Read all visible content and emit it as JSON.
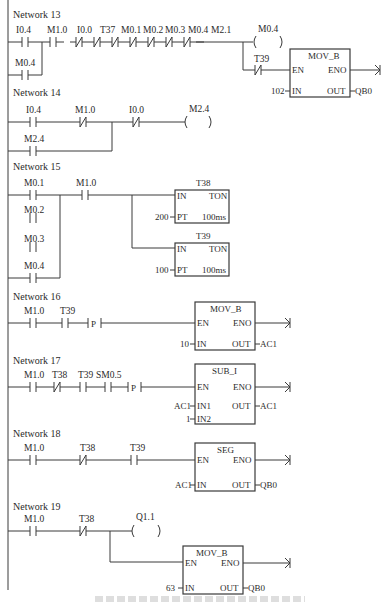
{
  "networks": [
    {
      "title": "Network 13",
      "contacts": [
        {
          "label": "I0.4",
          "type": "NO"
        },
        {
          "label": "M0.4",
          "type": "NO"
        },
        {
          "label": "M1.0",
          "type": "NO"
        },
        {
          "label": "I0.0",
          "type": "NC"
        },
        {
          "label": "T37",
          "type": "NC"
        },
        {
          "label": "M0.1",
          "type": "NC"
        },
        {
          "label": "M0.2",
          "type": "NC"
        },
        {
          "label": "M0.3",
          "type": "NC"
        },
        {
          "label": "M0.4",
          "type": "NC"
        },
        {
          "label": "M2.1",
          "type": "NC"
        },
        {
          "label": "T39",
          "type": "NC"
        }
      ],
      "coil": "M0.4",
      "block": {
        "name": "MOV_B",
        "en": "EN",
        "eno": "ENO",
        "in": "IN",
        "out": "OUT",
        "in_val": "102",
        "out_val": "QB0"
      }
    },
    {
      "title": "Network 14",
      "contacts": [
        {
          "label": "I0.4",
          "type": "NO"
        },
        {
          "label": "M1.0",
          "type": "NC"
        },
        {
          "label": "I0.0",
          "type": "NC"
        },
        {
          "label": "M2.4",
          "type": "NO"
        }
      ],
      "coil": "M2.4"
    },
    {
      "title": "Network 15",
      "contacts": [
        {
          "label": "M0.1",
          "type": "NO"
        },
        {
          "label": "M0.2",
          "type": "NO"
        },
        {
          "label": "M0.3",
          "type": "NO"
        },
        {
          "label": "M0.4",
          "type": "NO"
        },
        {
          "label": "M1.0",
          "type": "NO"
        }
      ],
      "timers": [
        {
          "name": "T38",
          "in": "IN",
          "type": "TON",
          "pt": "PT",
          "pt_val": "200",
          "base": "100ms"
        },
        {
          "name": "T39",
          "in": "IN",
          "type": "TON",
          "pt": "PT",
          "pt_val": "100",
          "base": "100ms"
        }
      ]
    },
    {
      "title": "Network 16",
      "contacts": [
        {
          "label": "M1.0",
          "type": "NO"
        },
        {
          "label": "T39",
          "type": "NO"
        }
      ],
      "edge": "P",
      "block": {
        "name": "MOV_B",
        "en": "EN",
        "eno": "ENO",
        "in": "IN",
        "out": "OUT",
        "in_val": "10",
        "out_val": "AC1"
      }
    },
    {
      "title": "Network 17",
      "contacts": [
        {
          "label": "M1.0",
          "type": "NO"
        },
        {
          "label": "T38",
          "type": "NC"
        },
        {
          "label": "T39",
          "type": "NO"
        },
        {
          "label": "SM0.5",
          "type": "NO"
        }
      ],
      "edge": "P",
      "block": {
        "name": "SUB_I",
        "en": "EN",
        "eno": "ENO",
        "in1": "IN1",
        "in2": "IN2",
        "out": "OUT",
        "in1_val": "AC1",
        "in2_val": "1",
        "out_val": "AC1"
      }
    },
    {
      "title": "Network 18",
      "contacts": [
        {
          "label": "M1.0",
          "type": "NO"
        },
        {
          "label": "T38",
          "type": "NC"
        },
        {
          "label": "T39",
          "type": "NO"
        }
      ],
      "block": {
        "name": "SEG",
        "en": "EN",
        "eno": "ENO",
        "in": "IN",
        "out": "OUT",
        "in_val": "AC1",
        "out_val": "QB0"
      }
    },
    {
      "title": "Network 19",
      "contacts": [
        {
          "label": "M1.0",
          "type": "NO"
        },
        {
          "label": "T38",
          "type": "NC"
        }
      ],
      "coil": "Q1.1",
      "block": {
        "name": "MOV_B",
        "en": "EN",
        "eno": "ENO",
        "in": "IN",
        "out": "OUT",
        "in_val": "63",
        "out_val": "QB0"
      }
    }
  ]
}
